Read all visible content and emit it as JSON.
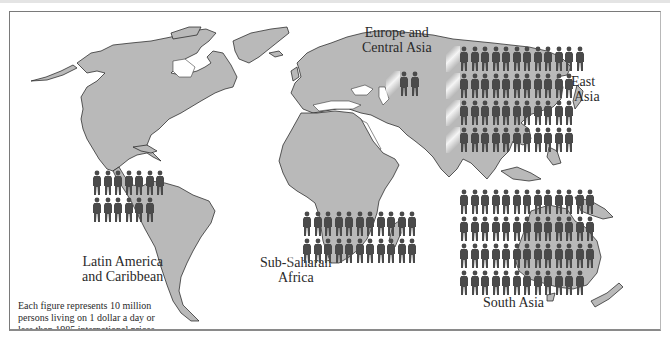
{
  "chart_data": {
    "type": "pictogram-map",
    "title": "",
    "unit": "Each figure represents 10 million persons",
    "footnote": "Each figure represents 10 million persons living on 1 dollar a day or less than 1985 international prices.",
    "categories": [
      "East Asia",
      "Europe and Central Asia",
      "Latin America and Caribbean",
      "Sub-Saharan Africa",
      "South Asia"
    ],
    "figure_counts": [
      45,
      2,
      13,
      22,
      51
    ],
    "values_millions": [
      450,
      20,
      130,
      220,
      510
    ],
    "row_layout": {
      "East Asia": [
        12,
        11,
        11,
        11
      ],
      "Europe and Central Asia": [
        2
      ],
      "Latin America and Caribbean": [
        7,
        6
      ],
      "Sub-Saharan Africa": [
        11,
        11
      ],
      "South Asia": [
        13,
        13,
        13,
        12
      ]
    },
    "colors": {
      "land": "#b9b9b9",
      "figure": "#4a4a4a",
      "ocean": "#ffffff",
      "coastline": "#1a1a1a"
    },
    "legend": "none"
  },
  "labels": {
    "europe": [
      "Europe and",
      "Central Asia"
    ],
    "east_asia": [
      "East",
      "Asia"
    ],
    "latin_america": [
      "Latin America",
      "and Caribbean"
    ],
    "africa": [
      "Sub-Saharan",
      "Africa"
    ],
    "south_asia": "South Asia"
  },
  "footnote_lines": [
    "Each figure represents 10 million",
    "persons living on 1 dollar a day or",
    "less than 1985 international prices."
  ]
}
